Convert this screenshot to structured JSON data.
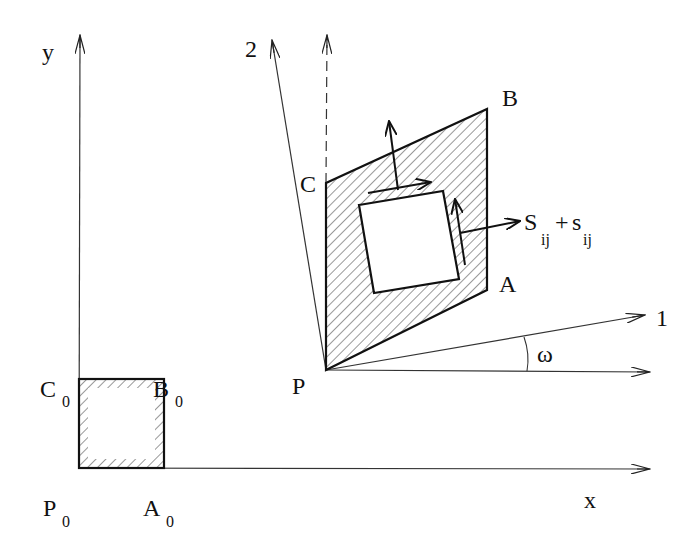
{
  "diagram": {
    "type": "deformation-schematic",
    "reference_axes": {
      "x_label": "x",
      "y_label": "y"
    },
    "rotated_axes": {
      "axis1_label": "1",
      "axis2_label": "2",
      "angle_label": "ω"
    },
    "undeformed": {
      "P": {
        "base": "P",
        "sub": "0"
      },
      "A": {
        "base": "A",
        "sub": "0"
      },
      "B": {
        "base": "B",
        "sub": "0"
      },
      "C": {
        "base": "C",
        "sub": "0"
      }
    },
    "deformed": {
      "P": "P",
      "A": "A",
      "B": "B",
      "C": "C"
    },
    "stress_label": {
      "S": "S",
      "S_sub": "ij",
      "plus": "+",
      "s": "s",
      "s_sub": "ij"
    }
  }
}
